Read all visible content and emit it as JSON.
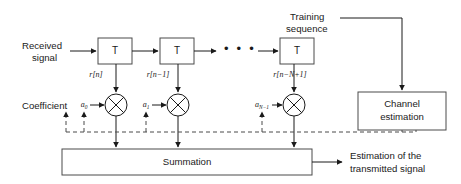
{
  "figure": {
    "width": 461,
    "height": 184,
    "background_color": "#ffffff",
    "line_color": "#1a1a1a",
    "box_stroke_color": "#4a4a4a",
    "dashed_stroke_color": "#4a4a4a"
  },
  "labels": {
    "received_signal_line1": "Received",
    "received_signal_line2": "signal",
    "training_sequence_line1": "Training",
    "training_sequence_line2": "sequence",
    "coefficient": "Coefficient",
    "summation": "Summation",
    "channel_estimation_line1": "Channel",
    "channel_estimation_line2": "estimation",
    "output_line1": "Estimation of the",
    "output_line2": "transmitted signal",
    "ellipsis": "• • •"
  },
  "delay_boxes": [
    {
      "id": "delay-1",
      "label": "T",
      "x": 98,
      "y": 38,
      "w": 34,
      "h": 26
    },
    {
      "id": "delay-2",
      "label": "T",
      "x": 160,
      "y": 38,
      "w": 34,
      "h": 26
    },
    {
      "id": "delay-3",
      "label": "T",
      "x": 280,
      "y": 38,
      "w": 34,
      "h": 26
    }
  ],
  "tap_signals": [
    {
      "id": "tap-0",
      "base": "r[n]",
      "sub": "",
      "x": 98,
      "y": 74
    },
    {
      "id": "tap-1",
      "base": "r[n−1]",
      "sub": "",
      "x": 160,
      "y": 74
    },
    {
      "id": "tap-2",
      "base": "r[n−N+1]",
      "sub": "",
      "x": 282,
      "y": 74
    }
  ],
  "coefficients": [
    {
      "id": "coef-0",
      "base": "a",
      "sub": "0",
      "x": 84,
      "y": 105
    },
    {
      "id": "coef-1",
      "base": "a",
      "sub": "1",
      "x": 146,
      "y": 105
    },
    {
      "id": "coef-2",
      "base": "a",
      "sub": "N−1",
      "x": 262,
      "y": 105
    }
  ],
  "mixers": [
    {
      "id": "mixer-0",
      "cx": 116,
      "cy": 105,
      "r": 11
    },
    {
      "id": "mixer-1",
      "cx": 178,
      "cy": 105,
      "r": 11
    },
    {
      "id": "mixer-2",
      "cx": 294,
      "cy": 105,
      "r": 11
    }
  ],
  "summation_box": {
    "x": 62,
    "y": 149,
    "w": 250,
    "h": 26
  },
  "channel_estimation_box": {
    "x": 358,
    "y": 92,
    "w": 88,
    "h": 38
  },
  "dashed_feedback_y": 132,
  "colors": {
    "text": "#1a1a1a",
    "box_outline": "#4a4a4a",
    "line": "#1a1a1a"
  }
}
